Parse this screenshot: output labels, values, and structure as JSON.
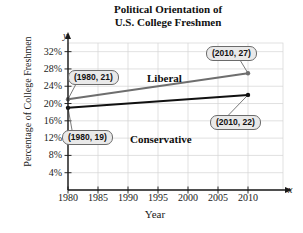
{
  "chart_data": {
    "type": "line",
    "title": "Political Orientation of U.S. College Freshmen",
    "title_line1": "Political Orientation of",
    "title_line2": "U.S. College Freshmen",
    "xlabel": "Year",
    "ylabel": "Percentage of College Freshmen",
    "x_axis_letter": "x",
    "y_axis_letter": "y",
    "grid": true,
    "legend_position": "inline-labels",
    "xlim": [
      1980,
      2013
    ],
    "ylim": [
      0,
      34
    ],
    "x_ticks": [
      "1980",
      "1985",
      "1990",
      "1995",
      "2000",
      "2005",
      "2010"
    ],
    "x_tick_values": [
      1980,
      1985,
      1990,
      1995,
      2000,
      2005,
      2010
    ],
    "y_ticks": [
      "4%",
      "8%",
      "12%",
      "16%",
      "20%",
      "24%",
      "28%",
      "32%"
    ],
    "y_tick_values": [
      4,
      8,
      12,
      16,
      20,
      24,
      28,
      32
    ],
    "x": [
      1980,
      2010
    ],
    "series": [
      {
        "name": "Liberal",
        "color": "#6e6e6e",
        "values": [
          21,
          27
        ]
      },
      {
        "name": "Conservative",
        "color": "#111111",
        "values": [
          19,
          22
        ]
      }
    ],
    "annotations": [
      {
        "id": "liberal-start",
        "text": "(1980, 21)",
        "point": [
          1980,
          21
        ]
      },
      {
        "id": "liberal-end",
        "text": "(2010, 27)",
        "point": [
          2010,
          27
        ]
      },
      {
        "id": "conservative-start",
        "text": "(1980, 19)",
        "point": [
          1980,
          19
        ]
      },
      {
        "id": "conservative-end",
        "text": "(2010, 22)",
        "point": [
          2010,
          22
        ]
      }
    ]
  }
}
